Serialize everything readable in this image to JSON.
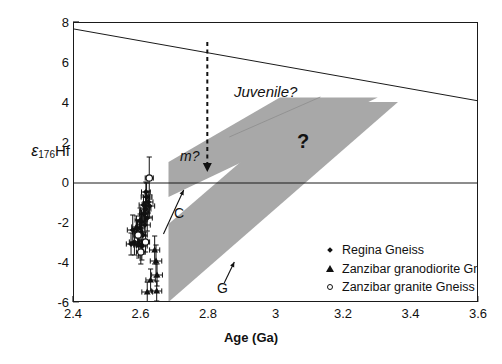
{
  "chart_data": {
    "type": "scatter",
    "title": "",
    "xlabel": "Age (Ga)",
    "ylabel_epsilon": "ε",
    "ylabel_sub": "176",
    "ylabel_tail": "Hf",
    "xlim": [
      2.4,
      3.6
    ],
    "ylim": [
      -6,
      8
    ],
    "xticks": [
      "2.4",
      "2.6",
      "2.8",
      "3",
      "3.2",
      "3.4",
      "3.6"
    ],
    "xtick_values": [
      2.4,
      2.6,
      2.8,
      3.0,
      3.2,
      3.4,
      3.6
    ],
    "yticks": [
      "8",
      "6",
      "4",
      "2",
      "0",
      "-2",
      "-4",
      "-6"
    ],
    "ytick_values": [
      8,
      6,
      4,
      2,
      0,
      -2,
      -4,
      -6
    ],
    "grid": false,
    "zero_line": true,
    "depleted_mantle_line": {
      "label": "Juvenile?",
      "x": [
        2.4,
        3.6
      ],
      "y": [
        7.7,
        4.1
      ]
    },
    "annotations": [
      {
        "name": "juvenile-label",
        "text": "Juvenile?",
        "x": 2.87,
        "y": 5.85,
        "italic": true
      },
      {
        "name": "mixing-label",
        "text": "m?",
        "x": 2.72,
        "y": 2.55,
        "italic": true
      },
      {
        "name": "question-mark-label",
        "text": "?",
        "x": 3.06,
        "y": 3.35
      },
      {
        "name": "c-label",
        "text": "C",
        "x": 2.7,
        "y": -0.55
      },
      {
        "name": "g-label",
        "text": "G",
        "x": 2.83,
        "y": -4.15
      }
    ],
    "mixing_arrow": {
      "name": "m-arrow",
      "style": "dashed-vertical-down",
      "x": 2.795,
      "y_start": 7.05,
      "y_end": 0.95
    },
    "crustal_arrays": [
      {
        "name": "upper-band",
        "label": "?",
        "polygon_xy": [
          [
            2.68,
            1.05
          ],
          [
            2.68,
            -0.7
          ],
          [
            3.3,
            4.28
          ],
          [
            3.01,
            4.28
          ]
        ]
      },
      {
        "name": "lower-band",
        "polygon_xy": [
          [
            2.68,
            -2.05
          ],
          [
            2.68,
            -5.95
          ],
          [
            3.36,
            4.05
          ],
          [
            3.1,
            4.05
          ]
        ]
      }
    ],
    "band_color": "#a8a8a8",
    "evolution_arrows": [
      {
        "name": "c-arrow",
        "x1": 2.665,
        "y1": -2.55,
        "x2": 2.725,
        "y2": -0.35
      },
      {
        "name": "g-arrow",
        "x1": 2.845,
        "y1": -5.0,
        "x2": 2.875,
        "y2": -3.95
      }
    ],
    "series": [
      {
        "name": "Regina Gneiss",
        "marker": "diamond",
        "points": [
          {
            "x": 2.615,
            "y": -0.7,
            "xerr": 0.016,
            "yerr": 0.7
          },
          {
            "x": 2.62,
            "y": -0.95,
            "xerr": 0.014,
            "yerr": 0.55
          },
          {
            "x": 2.612,
            "y": -1.3,
            "xerr": 0.016,
            "yerr": 0.6
          },
          {
            "x": 2.607,
            "y": -1.55,
            "xerr": 0.013,
            "yerr": 0.55
          },
          {
            "x": 2.617,
            "y": -1.75,
            "xerr": 0.015,
            "yerr": 0.65
          },
          {
            "x": 2.6,
            "y": -1.95,
            "xerr": 0.014,
            "yerr": 0.6
          },
          {
            "x": 2.61,
            "y": -2.1,
            "xerr": 0.016,
            "yerr": 0.55
          },
          {
            "x": 2.596,
            "y": -2.25,
            "xerr": 0.014,
            "yerr": 0.7
          },
          {
            "x": 2.588,
            "y": -2.45,
            "xerr": 0.015,
            "yerr": 0.6
          },
          {
            "x": 2.604,
            "y": -2.6,
            "xerr": 0.013,
            "yerr": 0.95
          },
          {
            "x": 2.574,
            "y": -2.35,
            "xerr": 0.016,
            "yerr": 0.75
          },
          {
            "x": 2.579,
            "y": -2.95,
            "xerr": 0.015,
            "yerr": 0.65
          },
          {
            "x": 2.592,
            "y": -3.05,
            "xerr": 0.014,
            "yerr": 0.6
          },
          {
            "x": 2.601,
            "y": -3.15,
            "xerr": 0.016,
            "yerr": 0.7
          },
          {
            "x": 2.569,
            "y": -3.05,
            "xerr": 0.014,
            "yerr": 0.55
          },
          {
            "x": 2.613,
            "y": -0.45,
            "xerr": 0.013,
            "yerr": 0.5
          },
          {
            "x": 2.624,
            "y": -1.15,
            "xerr": 0.015,
            "yerr": 0.55
          },
          {
            "x": 2.606,
            "y": -1.1,
            "xerr": 0.013,
            "yerr": 0.5
          }
        ]
      },
      {
        "name": "Zanzibar granodiorite Gneiss",
        "marker": "triangle",
        "points": [
          {
            "x": 2.596,
            "y": -1.85,
            "xerr": 0.015,
            "yerr": 0.6
          },
          {
            "x": 2.585,
            "y": -2.2,
            "xerr": 0.014,
            "yerr": 0.55
          },
          {
            "x": 2.609,
            "y": -1.45,
            "xerr": 0.013,
            "yerr": 0.5
          },
          {
            "x": 2.592,
            "y": -3.1,
            "xerr": 0.015,
            "yerr": 0.65
          },
          {
            "x": 2.643,
            "y": -3.9,
            "xerr": 0.017,
            "yerr": 0.8
          },
          {
            "x": 2.639,
            "y": -3.35,
            "xerr": 0.015,
            "yerr": 0.7
          },
          {
            "x": 2.646,
            "y": -4.6,
            "xerr": 0.016,
            "yerr": 0.55
          },
          {
            "x": 2.617,
            "y": -5.45,
            "xerr": 0.016,
            "yerr": 0.5
          },
          {
            "x": 2.645,
            "y": -5.4,
            "xerr": 0.015,
            "yerr": 0.5
          },
          {
            "x": 2.627,
            "y": -4.85,
            "xerr": 0.014,
            "yerr": 0.55
          }
        ]
      },
      {
        "name": "Zanzibar granite Gneiss",
        "marker": "circle",
        "points": [
          {
            "x": 2.623,
            "y": 0.25,
            "xerr": 0.012,
            "yerr": 1.05
          },
          {
            "x": 2.59,
            "y": -2.6,
            "xerr": 0.013,
            "yerr": 0.55
          },
          {
            "x": 2.598,
            "y": -3.45,
            "xerr": 0.013,
            "yerr": 0.6
          },
          {
            "x": 2.612,
            "y": -2.95,
            "xerr": 0.012,
            "yerr": 0.5
          }
        ]
      }
    ],
    "legend": {
      "position": "inside-right-lower",
      "entries": [
        {
          "label": "Regina Gneiss",
          "marker": "diamond"
        },
        {
          "label": "Zanzibar granodiorite Gneiss",
          "marker": "triangle"
        },
        {
          "label": "Zanzibar granite Gneiss",
          "marker": "circle"
        }
      ]
    }
  }
}
